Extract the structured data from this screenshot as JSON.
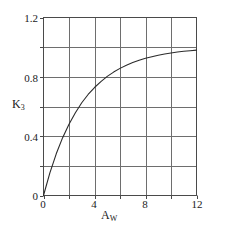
{
  "chart_data": {
    "type": "line",
    "title": "",
    "subtitle": "",
    "xlabel": "A_W",
    "xlabel_base": "A",
    "xlabel_sub": "W",
    "ylabel": "K_3",
    "ylabel_base": "K",
    "ylabel_sub": "3",
    "xlim": [
      0,
      12
    ],
    "ylim": [
      0,
      1.2
    ],
    "xticks": [
      0,
      4,
      8,
      12
    ],
    "xtick_labels": [
      "0",
      "4",
      "8",
      "12"
    ],
    "yticks": [
      0,
      0.4,
      0.8,
      1.2
    ],
    "ytick_labels": [
      "0",
      "0.4",
      "0.8",
      "1.2"
    ],
    "x_gridlines": [
      0,
      2,
      4,
      6,
      8,
      10,
      12
    ],
    "y_gridlines": [
      0,
      0.2,
      0.4,
      0.6,
      0.8,
      1.0,
      1.2
    ],
    "grid": true,
    "legend": "none",
    "series": [
      {
        "name": "K3 vs Aw",
        "x": [
          0,
          0.5,
          1,
          1.5,
          2,
          2.5,
          3,
          3.5,
          4,
          4.5,
          5,
          5.5,
          6,
          6.5,
          7,
          7.5,
          8,
          8.5,
          9,
          9.5,
          10,
          10.5,
          11,
          11.5,
          12
        ],
        "y": [
          0,
          0.152,
          0.281,
          0.39,
          0.48,
          0.558,
          0.625,
          0.681,
          0.728,
          0.768,
          0.803,
          0.832,
          0.857,
          0.878,
          0.896,
          0.912,
          0.925,
          0.936,
          0.946,
          0.954,
          0.961,
          0.967,
          0.972,
          0.976,
          0.98
        ]
      }
    ]
  },
  "style": {
    "line_color": "#2b2b2b",
    "grid_color": "#6e6e6e",
    "axis_color": "#4a4a4a",
    "background": "#ffffff",
    "text_color": "#1a1a1a"
  }
}
